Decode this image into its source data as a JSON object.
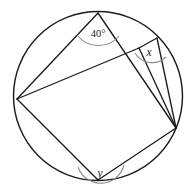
{
  "figure": {
    "type": "geometry-diagram",
    "shape": "circle",
    "stroke_color": "#1c1c1c",
    "arc_color": "#8a8a8a",
    "background_color": "#ffffff"
  },
  "circle": {
    "center_x": 98,
    "center_y": 96,
    "radius": 84.5
  },
  "points": {
    "top": {
      "name": "top-vertex",
      "x": 98,
      "y": 13
    },
    "left": {
      "name": "left-vertex",
      "x": 17,
      "y": 99
    },
    "bottom": {
      "name": "bottom-vertex",
      "x": 98,
      "y": 180
    },
    "right": {
      "name": "right-vertex",
      "x": 176,
      "y": 128
    },
    "upper_right": {
      "name": "upper-right-vertex",
      "x": 157,
      "y": 38
    },
    "quad_top_right": {
      "name": "quad-top-right-vertex",
      "x": 139,
      "y": 48
    }
  },
  "chords": [
    {
      "name": "chord-top-to-left",
      "from": "top",
      "to": "left"
    },
    {
      "name": "chord-top-to-right",
      "from": "top",
      "to": "right"
    },
    {
      "name": "chord-left-to-quad-top-right",
      "from": "left",
      "to": "quad_top_right"
    },
    {
      "name": "chord-quad-top-right-to-right",
      "from": "quad_top_right",
      "to": "right"
    },
    {
      "name": "chord-left-to-bottom",
      "from": "left",
      "to": "bottom"
    },
    {
      "name": "chord-bottom-to-right",
      "from": "bottom",
      "to": "right"
    },
    {
      "name": "chord-upper-right-to-quad-top-right",
      "from": "upper_right",
      "to": "quad_top_right"
    },
    {
      "name": "chord-upper-right-to-right",
      "from": "upper_right",
      "to": "right"
    }
  ],
  "angles": [
    {
      "name": "angle-40-degrees",
      "label": "40°",
      "value": 40,
      "unit": "degrees",
      "at_point": "top",
      "label_x": 98,
      "label_y": 33
    },
    {
      "name": "angle-x",
      "label": "x",
      "value": null,
      "unit": "unknown",
      "at_point": "upper_right",
      "label_x": 148,
      "label_y": 52
    },
    {
      "name": "angle-y",
      "label": "y",
      "value": null,
      "unit": "unknown",
      "at_point": "bottom",
      "label_x": 100,
      "label_y": 173
    }
  ]
}
